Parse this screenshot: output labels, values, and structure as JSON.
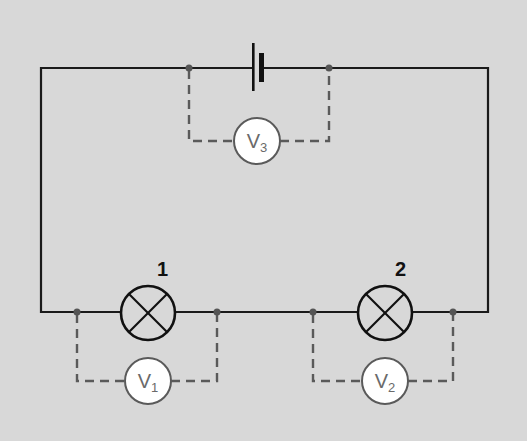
{
  "diagram": {
    "type": "series circuit with voltmeters",
    "background_color": "#d8d8d8",
    "wire_color": "#1a1a1a",
    "voltmeter_wire_color": "#5a5a5a",
    "components": {
      "battery": {
        "label": "",
        "icon": "battery-cell-icon"
      },
      "lamps": [
        {
          "id": "lamp-1",
          "label": "1",
          "icon": "lamp-icon"
        },
        {
          "id": "lamp-2",
          "label": "2",
          "icon": "lamp-icon"
        }
      ],
      "voltmeters": [
        {
          "id": "voltmeter-1",
          "symbol": "V",
          "subscript": "1",
          "measures": "lamp-1"
        },
        {
          "id": "voltmeter-2",
          "symbol": "V",
          "subscript": "2",
          "measures": "lamp-2"
        },
        {
          "id": "voltmeter-3",
          "symbol": "V",
          "subscript": "3",
          "measures": "battery"
        }
      ]
    }
  }
}
